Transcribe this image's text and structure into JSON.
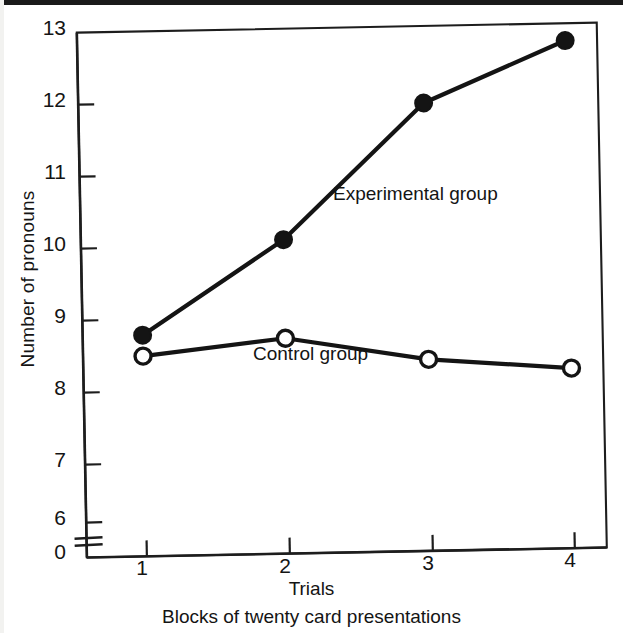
{
  "figure": {
    "background": "#ffffff",
    "ink_color": "#111111"
  },
  "axes": {
    "y_title": "Number of pronouns",
    "x_title": "Trials",
    "x_subtitle": "Blocks of twenty card presentations",
    "y_ticks": [
      "13",
      "12",
      "11",
      "10",
      "9",
      "8",
      "7",
      "6",
      "0"
    ],
    "x_ticks": [
      "1",
      "2",
      "3",
      "4"
    ],
    "y_axis_break": true
  },
  "series_labels": {
    "experimental": "Experimental group",
    "control": "Control group"
  },
  "chart_data": {
    "type": "line",
    "title": "",
    "xlabel": "Trials",
    "ylabel": "Number of pronouns",
    "x_sublabel": "Blocks of twenty card presentations",
    "categories": [
      "1",
      "2",
      "3",
      "4"
    ],
    "x": [
      1,
      2,
      3,
      4
    ],
    "xlim": [
      0.6,
      4.3
    ],
    "ylim": [
      6.0,
      13.0
    ],
    "y_axis_break_below": 6.0,
    "y_zero_shown": true,
    "yticks": [
      6,
      7,
      8,
      9,
      10,
      11,
      12,
      13
    ],
    "xticks": [
      1,
      2,
      3,
      4
    ],
    "grid": false,
    "legend": "inline-annotations",
    "series": [
      {
        "name": "Experimental group",
        "marker": "filled-circle",
        "color": "#111111",
        "values": [
          8.78,
          10.07,
          11.93,
          12.76
        ]
      },
      {
        "name": "Control group",
        "marker": "open-circle",
        "color": "#111111",
        "values": [
          8.49,
          8.7,
          8.37,
          8.21
        ]
      }
    ],
    "annotations": [
      {
        "text": "Experimental group",
        "x": 2.4,
        "y": 10.8
      },
      {
        "text": "Control group",
        "x": 1.8,
        "y": 8.15
      }
    ]
  }
}
